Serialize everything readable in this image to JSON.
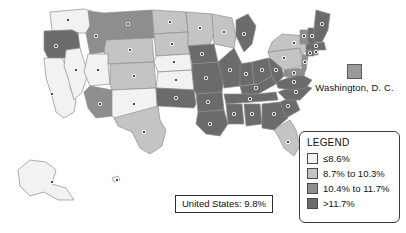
{
  "map": {
    "title": "United States choropleth map",
    "background_color": "#ffffff",
    "border_color": "#8c8c8c",
    "capital_dot_color": "#1a1a1a"
  },
  "dc_callout": {
    "label": "Washington, D. C.",
    "swatch_color": "#9a9a9a",
    "swatch_icon": "legend-swatch-icon"
  },
  "us_total": {
    "label": "United States: 9.8%"
  },
  "legend": {
    "title": "LEGEND",
    "items": [
      {
        "label": "≤8.6%",
        "color": "#f2f2f2"
      },
      {
        "label": "8.7% to 10.3%",
        "color": "#c4c4c4"
      },
      {
        "label": "10.4% to 11.7%",
        "color": "#8e8e8e"
      },
      {
        "label": ">11.7%",
        "color": "#6b6b6b"
      }
    ]
  },
  "chart_data": {
    "type": "choropleth",
    "value_unit": "%",
    "national_value": 9.8,
    "bins": [
      {
        "label": "≤8.6%",
        "color": "#f2f2f2",
        "min": null,
        "max": 8.6
      },
      {
        "label": "8.7% to 10.3%",
        "color": "#c4c4c4",
        "min": 8.7,
        "max": 10.3
      },
      {
        "label": "10.4% to 11.7%",
        "color": "#8e8e8e",
        "min": 10.4,
        "max": 11.7
      },
      {
        "label": ">11.7%",
        "color": "#6b6b6b",
        "min": 11.7,
        "max": null
      }
    ],
    "regions": [
      {
        "code": "WA",
        "bin": 0
      },
      {
        "code": "OR",
        "bin": 3
      },
      {
        "code": "CA",
        "bin": 0
      },
      {
        "code": "NV",
        "bin": 0
      },
      {
        "code": "ID",
        "bin": 2
      },
      {
        "code": "MT",
        "bin": 2
      },
      {
        "code": "WY",
        "bin": 1
      },
      {
        "code": "UT",
        "bin": 0
      },
      {
        "code": "AZ",
        "bin": 2
      },
      {
        "code": "CO",
        "bin": 1
      },
      {
        "code": "NM",
        "bin": 0
      },
      {
        "code": "ND",
        "bin": 1
      },
      {
        "code": "SD",
        "bin": 1
      },
      {
        "code": "NE",
        "bin": 0
      },
      {
        "code": "KS",
        "bin": 0
      },
      {
        "code": "OK",
        "bin": 3
      },
      {
        "code": "TX",
        "bin": 1
      },
      {
        "code": "MN",
        "bin": 1
      },
      {
        "code": "IA",
        "bin": 3
      },
      {
        "code": "MO",
        "bin": 3
      },
      {
        "code": "AR",
        "bin": 3
      },
      {
        "code": "LA",
        "bin": 3
      },
      {
        "code": "WI",
        "bin": 1
      },
      {
        "code": "IL",
        "bin": 3
      },
      {
        "code": "MI",
        "bin": 3
      },
      {
        "code": "IN",
        "bin": 3
      },
      {
        "code": "OH",
        "bin": 3
      },
      {
        "code": "KY",
        "bin": 3
      },
      {
        "code": "TN",
        "bin": 3
      },
      {
        "code": "MS",
        "bin": 3
      },
      {
        "code": "AL",
        "bin": 3
      },
      {
        "code": "GA",
        "bin": 3
      },
      {
        "code": "FL",
        "bin": 1
      },
      {
        "code": "SC",
        "bin": 3
      },
      {
        "code": "NC",
        "bin": 3
      },
      {
        "code": "VA",
        "bin": 3
      },
      {
        "code": "WV",
        "bin": 3
      },
      {
        "code": "MD",
        "bin": 2
      },
      {
        "code": "DE",
        "bin": 2
      },
      {
        "code": "PA",
        "bin": 1
      },
      {
        "code": "NJ",
        "bin": 2
      },
      {
        "code": "NY",
        "bin": 1
      },
      {
        "code": "CT",
        "bin": 3
      },
      {
        "code": "RI",
        "bin": 3
      },
      {
        "code": "MA",
        "bin": 3
      },
      {
        "code": "VT",
        "bin": 2
      },
      {
        "code": "NH",
        "bin": 3
      },
      {
        "code": "ME",
        "bin": 3
      },
      {
        "code": "AK",
        "bin": 0
      },
      {
        "code": "HI",
        "bin": 0
      },
      {
        "code": "DC",
        "bin": 2
      }
    ]
  }
}
